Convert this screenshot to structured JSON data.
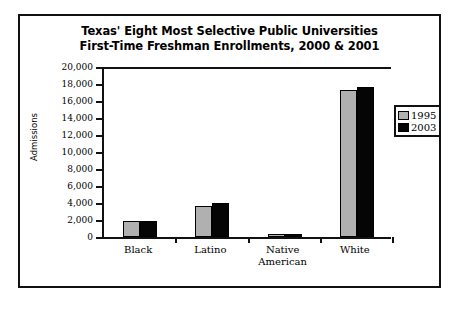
{
  "chart_data": {
    "type": "bar",
    "title": "Texas' Eight Most Selective Public Universities First-Time Freshman Enrollments, 2000 & 2001",
    "title_lines": [
      "Texas' Eight Most Selective Public Universities",
      "First-Time Freshman Enrollments, 2000 & 2001"
    ],
    "xlabel": "",
    "ylabel": "Admissions",
    "ylim": [
      0,
      20000
    ],
    "ytick_step": 2000,
    "ytick_labels": [
      "20,000",
      "18,000",
      "16,000",
      "14,000",
      "12,000",
      "10,000",
      "8,000",
      "6,000",
      "4,000",
      "2,000",
      "0"
    ],
    "ytick_values": [
      20000,
      18000,
      16000,
      14000,
      12000,
      10000,
      8000,
      6000,
      4000,
      2000,
      0
    ],
    "grid": false,
    "legend_position": "right",
    "categories": [
      "Black",
      "Latino",
      "Native American",
      "White"
    ],
    "category_label_lines": [
      [
        "Black"
      ],
      [
        "Latino"
      ],
      [
        "Native",
        "American"
      ],
      [
        "White"
      ]
    ],
    "series": [
      {
        "name": "1995",
        "color": "#b0b0b0",
        "values": [
          1850,
          3700,
          300,
          17350
        ]
      },
      {
        "name": "2003",
        "color": "#050505",
        "values": [
          1850,
          3950,
          300,
          17700
        ]
      }
    ]
  },
  "legend": {
    "items": [
      {
        "label": "1995",
        "color": "#b0b0b0"
      },
      {
        "label": "2003",
        "color": "#050505"
      }
    ]
  },
  "colors": {
    "series_1995": "#b0b0b0",
    "series_2003": "#050505",
    "frame": "#111111",
    "background": "#ffffff"
  }
}
